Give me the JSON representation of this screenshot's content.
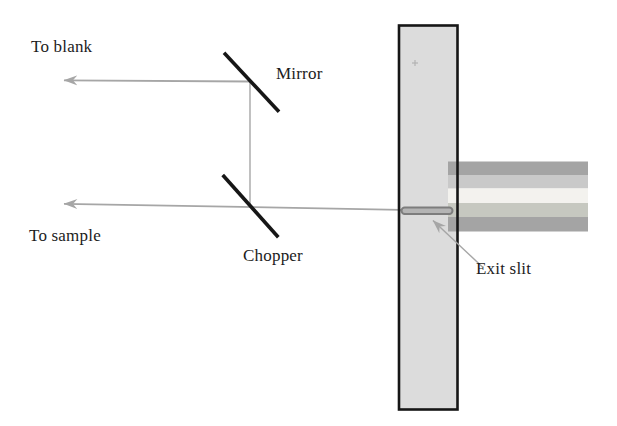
{
  "colors": {
    "background": "#ffffff",
    "beam": "#a6a6a6",
    "optic": "#161616",
    "label_text": "#1c1c1c",
    "panel_fill": "#dcdcdc",
    "panel_border": "#161616",
    "bar_outer": "#a4a4a4",
    "bar_inner_top": "#c9c9c9",
    "bar_inner_bottom": "#c6c8c0",
    "bar_core": "#f3f2ee",
    "slit_fill": "#b4b4b4",
    "slit_border": "#7d7d7d",
    "plus_mark": "#b3b3b3"
  },
  "diagram": {
    "labels": {
      "to_blank": "To blank",
      "mirror": "Mirror",
      "chopper": "Chopper",
      "to_sample": "To sample",
      "exit_slit": "Exit slit"
    }
  }
}
